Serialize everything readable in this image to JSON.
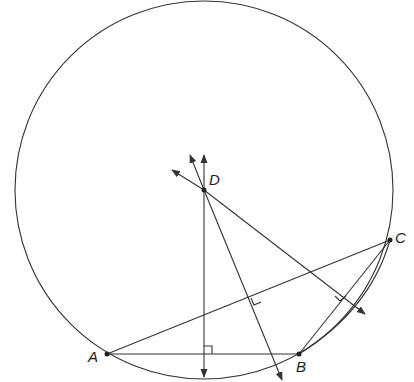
{
  "diagram": {
    "type": "circumcircle construction",
    "points": {
      "A": {
        "label": "A",
        "x": 107,
        "y": 354
      },
      "B": {
        "label": "B",
        "x": 299,
        "y": 354
      },
      "C": {
        "label": "C",
        "x": 390,
        "y": 240
      },
      "D": {
        "label": "D",
        "x": 204,
        "y": 190
      }
    },
    "circle": {
      "center": "D",
      "radius": 189
    },
    "colors": {
      "stroke": "#333333",
      "background": "#ffffff"
    }
  }
}
